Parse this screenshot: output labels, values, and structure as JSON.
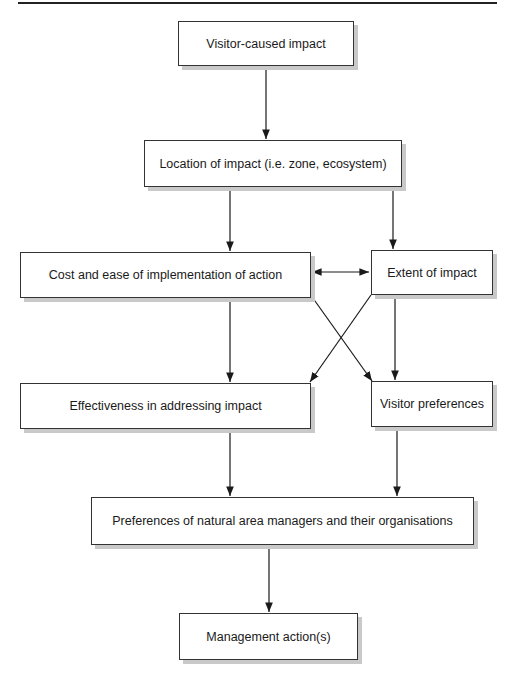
{
  "diagram": {
    "nodes": [
      {
        "id": "visitor_caused_impact",
        "label": "Visitor-caused impact"
      },
      {
        "id": "location_of_impact",
        "label": "Location of impact (i.e. zone, ecosystem)"
      },
      {
        "id": "cost_and_ease",
        "label": "Cost and ease of implementation of action"
      },
      {
        "id": "extent_of_impact",
        "label": "Extent of impact"
      },
      {
        "id": "effectiveness",
        "label": "Effectiveness in addressing impact"
      },
      {
        "id": "visitor_preferences",
        "label": "Visitor preferences"
      },
      {
        "id": "manager_preferences",
        "label": "Preferences of natural area managers and their organisations"
      },
      {
        "id": "management_actions",
        "label": "Management action(s)"
      }
    ],
    "edges": [
      {
        "from": "visitor_caused_impact",
        "to": "location_of_impact"
      },
      {
        "from": "location_of_impact",
        "to": "cost_and_ease"
      },
      {
        "from": "location_of_impact",
        "to": "extent_of_impact"
      },
      {
        "from": "cost_and_ease",
        "to": "extent_of_impact",
        "bidirectional": true
      },
      {
        "from": "cost_and_ease",
        "to": "effectiveness"
      },
      {
        "from": "cost_and_ease",
        "to": "visitor_preferences"
      },
      {
        "from": "extent_of_impact",
        "to": "effectiveness"
      },
      {
        "from": "extent_of_impact",
        "to": "visitor_preferences"
      },
      {
        "from": "effectiveness",
        "to": "manager_preferences"
      },
      {
        "from": "visitor_preferences",
        "to": "manager_preferences"
      },
      {
        "from": "manager_preferences",
        "to": "management_actions"
      }
    ]
  }
}
